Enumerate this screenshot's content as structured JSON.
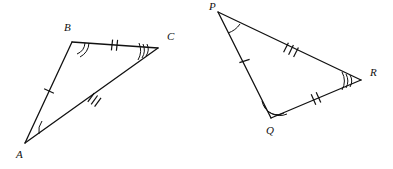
{
  "figure": {
    "background_color": "#ffffff",
    "stroke_color": "#111111",
    "mark_color": "#111111",
    "width": 393,
    "height": 169
  },
  "triangles": [
    {
      "name": "triangle-abc",
      "vertices": [
        {
          "label": "A",
          "x": 25,
          "y": 143,
          "label_x": 16,
          "label_y": 158,
          "angle_arcs": 1
        },
        {
          "label": "B",
          "x": 72,
          "y": 42,
          "label_x": 64,
          "label_y": 31,
          "angle_arcs": 2
        },
        {
          "label": "C",
          "x": 158,
          "y": 48,
          "label_x": 167,
          "label_y": 40,
          "angle_arcs": 3
        }
      ],
      "sides": [
        {
          "name": "side-ab",
          "from": "A",
          "to": "B",
          "ticks": 1
        },
        {
          "name": "side-bc",
          "from": "B",
          "to": "C",
          "ticks": 2
        },
        {
          "name": "side-ac",
          "from": "A",
          "to": "C",
          "ticks": 3
        }
      ]
    },
    {
      "name": "triangle-pqr",
      "vertices": [
        {
          "label": "P",
          "x": 218,
          "y": 12,
          "label_x": 209,
          "label_y": 10,
          "angle_arcs": 1
        },
        {
          "label": "Q",
          "x": 271,
          "y": 118,
          "label_x": 266,
          "label_y": 134,
          "angle_arcs": 2
        },
        {
          "label": "R",
          "x": 361,
          "y": 80,
          "label_x": 370,
          "label_y": 76,
          "angle_arcs": 3
        }
      ],
      "sides": [
        {
          "name": "side-pq",
          "from": "P",
          "to": "Q",
          "ticks": 1
        },
        {
          "name": "side-pr",
          "from": "P",
          "to": "R",
          "ticks": 3
        },
        {
          "name": "side-qr",
          "from": "Q",
          "to": "R",
          "ticks": 2
        }
      ]
    }
  ],
  "labels": {
    "a": "A",
    "b": "B",
    "c": "C",
    "p": "P",
    "q": "Q",
    "r": "R"
  }
}
